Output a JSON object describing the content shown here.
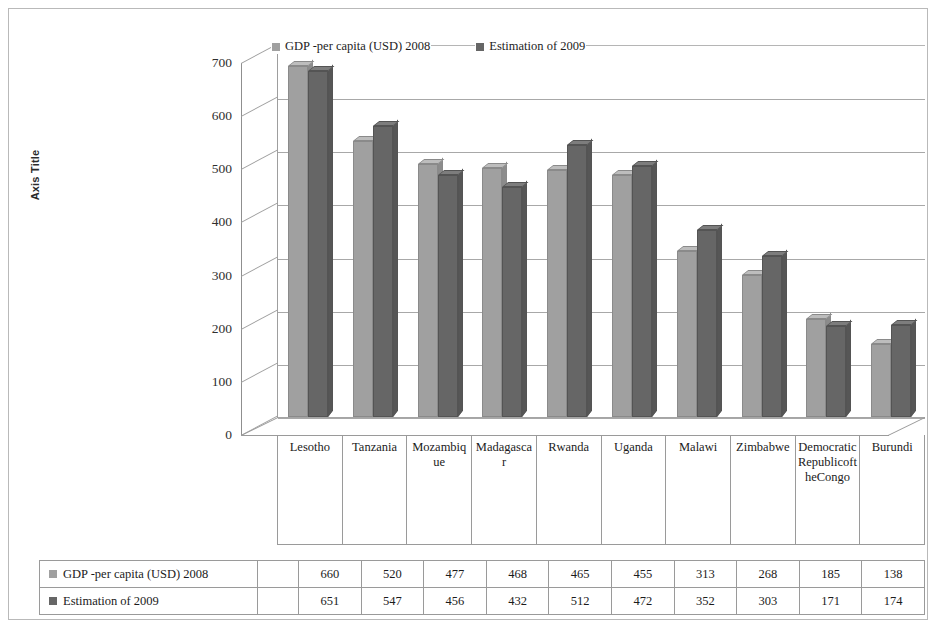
{
  "chart_data": {
    "type": "bar",
    "title": "",
    "xlabel": "",
    "ylabel": "Axis Title",
    "ylim": [
      0,
      700
    ],
    "yticks": [
      700,
      600,
      500,
      400,
      300,
      200,
      100,
      0
    ],
    "grid": true,
    "legend_position": "top",
    "categories": [
      "Lesotho",
      "Tanzania",
      "Mozambique",
      "Madagascar",
      "Rwanda",
      "Uganda",
      "Malawi",
      "Zimbabwe",
      "Democratic Republic of the Congo",
      "Burundi"
    ],
    "series": [
      {
        "name": "GDP -per capita (USD) 2008",
        "color": "#a0a0a0",
        "values": [
          660,
          520,
          477,
          468,
          465,
          455,
          313,
          268,
          185,
          138
        ]
      },
      {
        "name": "Estimation of 2009",
        "color": "#666666",
        "values": [
          651,
          547,
          456,
          432,
          512,
          472,
          352,
          303,
          171,
          174
        ]
      }
    ]
  },
  "axis": {
    "vertical_title": "Axis Title"
  },
  "legend": {
    "items": [
      {
        "label": "GDP -per capita (USD) 2008",
        "color": "#a0a0a0"
      },
      {
        "label": "Estimation of 2009",
        "color": "#666666"
      }
    ]
  },
  "data_table": {
    "rows": [
      {
        "label": "GDP -per capita (USD) 2008",
        "color": "#a0a0a0",
        "values": [
          "660",
          "520",
          "477",
          "468",
          "465",
          "455",
          "313",
          "268",
          "185",
          "138"
        ]
      },
      {
        "label": "Estimation of 2009",
        "color": "#666666",
        "values": [
          "651",
          "547",
          "456",
          "432",
          "512",
          "472",
          "352",
          "303",
          "171",
          "174"
        ]
      }
    ]
  }
}
